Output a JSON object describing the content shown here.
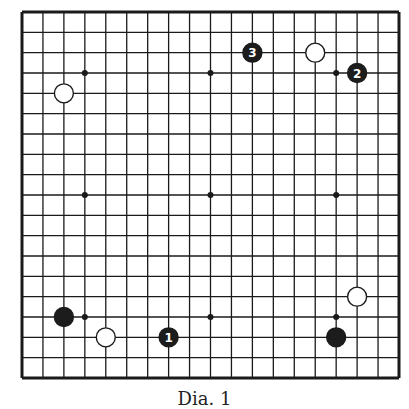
{
  "board": {
    "size": 19,
    "left": 22,
    "top": 12,
    "right": 399,
    "bottom": 378,
    "line_color": "#1a1a1a",
    "background": "#ffffff",
    "star_points": [
      [
        4,
        4
      ],
      [
        10,
        4
      ],
      [
        16,
        4
      ],
      [
        4,
        10
      ],
      [
        10,
        10
      ],
      [
        16,
        10
      ],
      [
        4,
        16
      ],
      [
        10,
        16
      ],
      [
        16,
        16
      ]
    ]
  },
  "stones": [
    {
      "color": "white",
      "col": 3,
      "row": 5,
      "label": ""
    },
    {
      "color": "black",
      "col": 12,
      "row": 3,
      "label": "3"
    },
    {
      "color": "white",
      "col": 15,
      "row": 3,
      "label": ""
    },
    {
      "color": "black",
      "col": 17,
      "row": 4,
      "label": "2"
    },
    {
      "color": "black",
      "col": 3,
      "row": 16,
      "label": ""
    },
    {
      "color": "white",
      "col": 5,
      "row": 17,
      "label": ""
    },
    {
      "color": "black",
      "col": 8,
      "row": 17,
      "label": "1"
    },
    {
      "color": "white",
      "col": 17,
      "row": 15,
      "label": ""
    },
    {
      "color": "black",
      "col": 16,
      "row": 17,
      "label": ""
    }
  ],
  "caption": "Dia. 1"
}
